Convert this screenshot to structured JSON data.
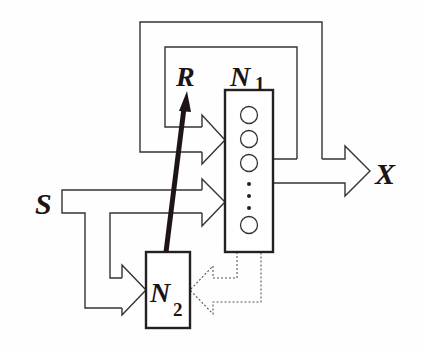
{
  "diagram": {
    "type": "block-diagram",
    "labels": {
      "input": "S",
      "output": "X",
      "reward": "R",
      "network1": "N",
      "network1_sub": "1",
      "network2": "N",
      "network2_sub": "2"
    },
    "nodes": [
      {
        "id": "N1",
        "label": "N1",
        "units_visible": 4,
        "ellipsis": true
      },
      {
        "id": "N2",
        "label": "N2"
      }
    ],
    "edges": [
      {
        "from": "S",
        "to": "N1",
        "style": "block-arrow"
      },
      {
        "from": "S",
        "to": "N2",
        "style": "block-arrow"
      },
      {
        "from": "N1",
        "to": "X",
        "style": "block-arrow"
      },
      {
        "from": "N1",
        "to": "N1",
        "style": "feedback-loop-inner"
      },
      {
        "from": "N1",
        "to": "N1",
        "style": "feedback-loop-outer"
      },
      {
        "from": "N2",
        "to": "R",
        "style": "thick-arrow"
      },
      {
        "from": "N1",
        "to": "N2",
        "style": "dotted-block-arrow"
      }
    ],
    "colors": {
      "line": "#333333",
      "text": "#1a1414",
      "background": "#fefefe"
    }
  }
}
